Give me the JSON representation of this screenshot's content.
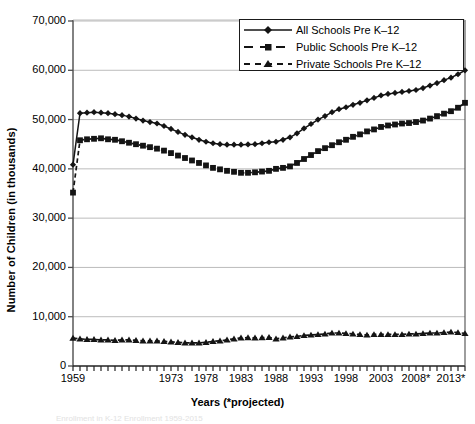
{
  "axes": {
    "ylabel": "Number of Children (in thousands)",
    "xlabel": "Years (*projected)",
    "yticks": [
      "0",
      "10,000",
      "20,000",
      "30,000",
      "40,000",
      "50,000",
      "60,000",
      "70,000"
    ],
    "xticks": [
      "1959",
      "1973",
      "1978",
      "1983",
      "1988",
      "1993",
      "1998",
      "2003",
      "2008*",
      "2013*"
    ]
  },
  "legend": {
    "items": [
      {
        "label": "All Schools Pre K–12",
        "marker": "diamond",
        "style": "solid"
      },
      {
        "label": "Public Schools Pre K–12",
        "marker": "square",
        "style": "dashed"
      },
      {
        "label": "Private Schools Pre K–12",
        "marker": "triangle",
        "style": "dashed"
      }
    ]
  },
  "caption": "Enrollment in K-12 Enrollment 1959-2015",
  "colors": {
    "line": "#141414",
    "gridline": "#b4b4b4",
    "axis": "#4d4d4d",
    "background": "#ffffff"
  },
  "chart_data": {
    "type": "line",
    "title": "",
    "xlabel": "Years (*projected)",
    "ylabel": "Number of Children (in thousands)",
    "xlim": [
      1959,
      2015
    ],
    "ylim": [
      0,
      70000
    ],
    "grid": true,
    "legend_position": "top-right",
    "x": [
      1959,
      1960,
      1961,
      1962,
      1963,
      1964,
      1965,
      1966,
      1967,
      1968,
      1969,
      1970,
      1971,
      1972,
      1973,
      1974,
      1975,
      1976,
      1977,
      1978,
      1979,
      1980,
      1981,
      1982,
      1983,
      1984,
      1985,
      1986,
      1987,
      1988,
      1989,
      1990,
      1991,
      1992,
      1993,
      1994,
      1995,
      1996,
      1997,
      1998,
      1999,
      2000,
      2001,
      2002,
      2003,
      2004,
      2005,
      2006,
      2007,
      2008,
      2009,
      2010,
      2011,
      2012,
      2013,
      2014,
      2015
    ],
    "series": [
      {
        "name": "All Schools Pre K–12",
        "marker": "diamond",
        "style": "solid",
        "values": [
          40857,
          51300,
          51400,
          51500,
          51400,
          51300,
          51100,
          50900,
          50600,
          50200,
          49800,
          49500,
          49200,
          48700,
          48100,
          47500,
          46900,
          46400,
          45900,
          45500,
          45200,
          45000,
          44900,
          44900,
          44900,
          44950,
          45000,
          45200,
          45400,
          45500,
          45900,
          46400,
          47200,
          48200,
          49100,
          50000,
          50700,
          51500,
          52100,
          52500,
          53000,
          53400,
          53900,
          54400,
          54900,
          55200,
          55400,
          55600,
          55800,
          56000,
          56400,
          56900,
          57400,
          58000,
          58500,
          59200,
          60000
        ]
      },
      {
        "name": "Public Schools Pre K–12",
        "marker": "square",
        "style": "dashed",
        "values": [
          35182,
          45800,
          46000,
          46100,
          46200,
          46000,
          45900,
          45600,
          45300,
          45000,
          44700,
          44400,
          44100,
          43700,
          43200,
          42700,
          42200,
          41700,
          41200,
          40700,
          40200,
          39900,
          39600,
          39400,
          39200,
          39200,
          39300,
          39450,
          39600,
          40000,
          40200,
          40500,
          41200,
          42000,
          42800,
          43600,
          44200,
          44800,
          45400,
          45900,
          46500,
          47000,
          47600,
          48000,
          48500,
          48800,
          49000,
          49200,
          49300,
          49500,
          49800,
          50200,
          50700,
          51200,
          51700,
          52400,
          53400
        ]
      },
      {
        "name": "Private Schools Pre K–12",
        "marker": "triangle",
        "style": "dashed",
        "values": [
          5675,
          5500,
          5400,
          5400,
          5300,
          5300,
          5200,
          5300,
          5300,
          5200,
          5100,
          5100,
          5100,
          5000,
          4900,
          4800,
          4700,
          4700,
          4700,
          4800,
          5000,
          5100,
          5300,
          5500,
          5700,
          5750,
          5700,
          5750,
          5800,
          5500,
          5700,
          5900,
          6000,
          6200,
          6300,
          6400,
          6500,
          6700,
          6700,
          6600,
          6500,
          6400,
          6300,
          6400,
          6400,
          6400,
          6400,
          6400,
          6500,
          6500,
          6600,
          6700,
          6700,
          6800,
          6900,
          6800,
          6600
        ]
      }
    ]
  }
}
